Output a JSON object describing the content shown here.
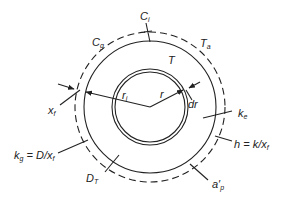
{
  "diagram": {
    "center": [
      150,
      107
    ],
    "circles": {
      "outer_dashed_film_radius": 75,
      "outer_solid_radius": 66,
      "inner_shell_outer_radius": 38,
      "inner_shell_inner_radius": 35
    },
    "labels": {
      "Ci": {
        "main": "C",
        "sub": "i"
      },
      "Cg": {
        "main": "C",
        "sub": "g"
      },
      "Ta": {
        "main": "T",
        "sub": "a"
      },
      "T": {
        "main": "T",
        "sub": ""
      },
      "xf": {
        "main": "x",
        "sub": "f"
      },
      "ri": {
        "main": "r",
        "sub": "i"
      },
      "r": {
        "main": "r",
        "sub": ""
      },
      "dr": {
        "main": "dr",
        "sub": ""
      },
      "ke": {
        "main": "k",
        "sub": "e"
      },
      "h": {
        "main": "h = k/x",
        "sub": "f"
      },
      "kg": {
        "main": "k",
        "sub": "g",
        "rest": " = D/x",
        "rest_sub": "f"
      },
      "DT": {
        "main": "D",
        "sub": "T"
      },
      "ap": {
        "main": "a′",
        "sub": "p"
      }
    },
    "colors": {
      "line": "#222222",
      "background": "#ffffff"
    }
  }
}
